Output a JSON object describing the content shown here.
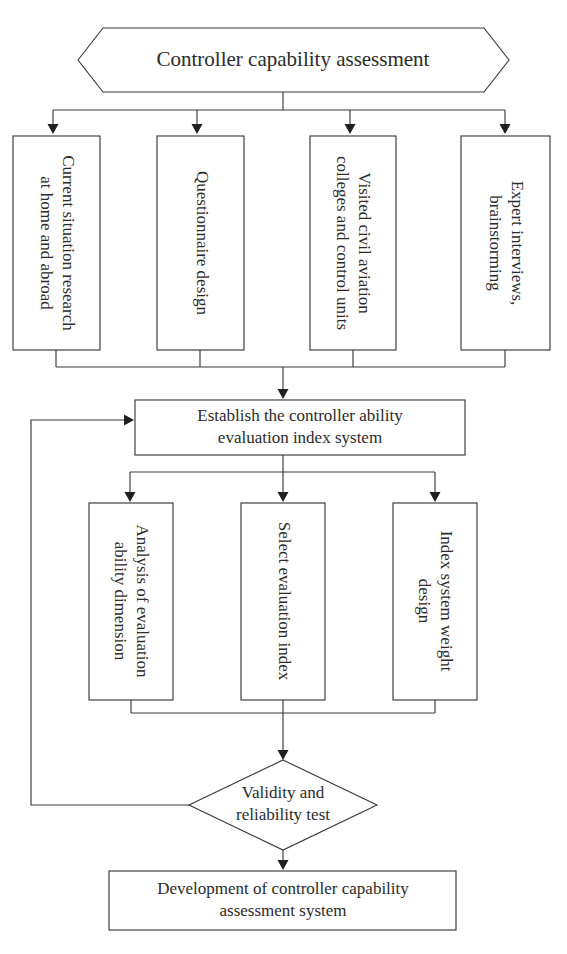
{
  "diagram": {
    "colors": {
      "stroke": "#3a3a3a",
      "text": "#2b2b2b",
      "fill": "#ffffff",
      "arrow": "#1f1f1f"
    },
    "start": {
      "label": "Controller capability assessment",
      "shape": "hexagon"
    },
    "inputs": [
      {
        "label_lines": [
          "Current situation research",
          "at home and abroad"
        ],
        "orientation": "vertical"
      },
      {
        "label_lines": [
          "Questionnaire design"
        ],
        "orientation": "vertical"
      },
      {
        "label_lines": [
          "Visited civil aviation",
          "colleges and control units"
        ],
        "orientation": "vertical"
      },
      {
        "label_lines": [
          "Expert interviews,",
          "brainstorming"
        ],
        "orientation": "vertical"
      }
    ],
    "establish": {
      "label_lines": [
        "Establish the controller ability",
        "evaluation index system"
      ],
      "shape": "rectangle"
    },
    "steps": [
      {
        "label_lines": [
          "Analysis of evaluation",
          "ability dimension"
        ],
        "orientation": "vertical"
      },
      {
        "label_lines": [
          "Select evaluation index"
        ],
        "orientation": "vertical"
      },
      {
        "label_lines": [
          "Index system weight",
          "design"
        ],
        "orientation": "vertical"
      }
    ],
    "decision": {
      "label_lines": [
        "Validity and",
        "reliability test"
      ],
      "shape": "diamond"
    },
    "end": {
      "label_lines": [
        "Development of controller capability",
        "assessment system"
      ],
      "shape": "rectangle"
    },
    "feedback": {
      "description": "Validity and reliability test feeds back to Establish the controller ability evaluation index system"
    }
  }
}
